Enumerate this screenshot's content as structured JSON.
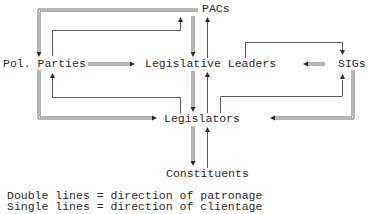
{
  "diagram": {
    "nodes": {
      "pacs": "PACs",
      "pol_parties": "Pol. Parties",
      "legislative_leaders": "Legislative Leaders",
      "sigs": "SIGs",
      "legislators": "Legislators",
      "constituents": "Constituents"
    },
    "edges": [
      {
        "from": "PACs",
        "to": "Pol. Parties",
        "type": "double"
      },
      {
        "from": "Pol. Parties",
        "to": "PACs",
        "type": "single"
      },
      {
        "from": "PACs",
        "to": "Legislative Leaders",
        "type": "double"
      },
      {
        "from": "Legislative Leaders",
        "to": "PACs",
        "type": "single"
      },
      {
        "from": "Pol. Parties",
        "to": "Legislative Leaders",
        "type": "double"
      },
      {
        "from": "SIGs",
        "to": "Legislative Leaders",
        "type": "double"
      },
      {
        "from": "Legislative Leaders",
        "to": "SIGs",
        "type": "single"
      },
      {
        "from": "Legislative Leaders",
        "to": "Legislators",
        "type": "double"
      },
      {
        "from": "Legislators",
        "to": "Legislative Leaders",
        "type": "single"
      },
      {
        "from": "Pol. Parties",
        "to": "Legislators",
        "type": "double"
      },
      {
        "from": "Legislators",
        "to": "Pol. Parties",
        "type": "single"
      },
      {
        "from": "SIGs",
        "to": "Legislators",
        "type": "double"
      },
      {
        "from": "Legislators",
        "to": "SIGs",
        "type": "single"
      },
      {
        "from": "Legislators",
        "to": "Constituents",
        "type": "double"
      },
      {
        "from": "Constituents",
        "to": "Legislators",
        "type": "single"
      }
    ]
  },
  "legend": {
    "double": "Double lines = direction of patronage",
    "single": "Single lines = direction of clientage"
  }
}
